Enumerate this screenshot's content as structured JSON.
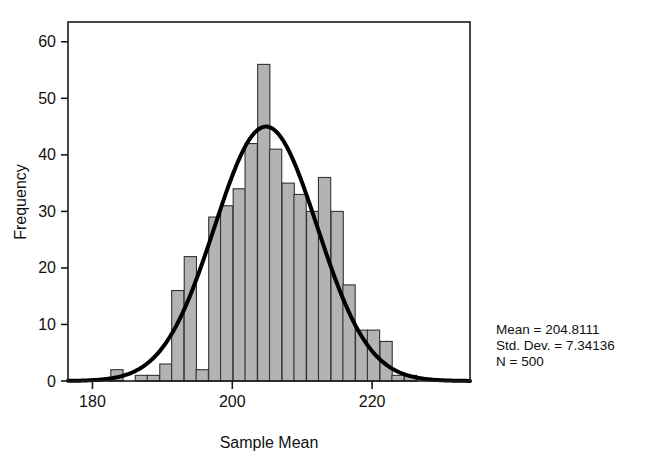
{
  "chart_data": {
    "type": "bar",
    "title": "",
    "subtitle": "",
    "xlabel": "Sample Mean",
    "ylabel": "Frequency",
    "xlim": [
      176.5,
      234.0
    ],
    "ylim": [
      0,
      63.5
    ],
    "xticks": [
      180,
      200,
      220
    ],
    "yticks": [
      0,
      10,
      20,
      30,
      40,
      50,
      60
    ],
    "grid": false,
    "legend": null,
    "bin_width": 1.75,
    "categories": [
      183.5,
      185.2,
      187.0,
      188.7,
      190.5,
      192.2,
      194.0,
      195.7,
      197.5,
      199.2,
      201.0,
      202.7,
      204.5,
      206.2,
      208.0,
      209.7,
      211.5,
      213.2,
      215.0,
      216.7,
      218.5,
      220.2,
      222.0,
      223.7,
      225.5,
      227.2
    ],
    "values": [
      2,
      0,
      1,
      1,
      3,
      16,
      22,
      2,
      29,
      31,
      34,
      42,
      56,
      41,
      35,
      33,
      30,
      36,
      30,
      17,
      9,
      9,
      7,
      1,
      1,
      0
    ],
    "overlay_curve": {
      "name": "Normal",
      "mean": 204.8111,
      "std_dev": 7.34136,
      "n": 500,
      "peak_value": 45,
      "color": "#000000",
      "line_width": 4
    },
    "bar_fill_color": "#b3b3b3",
    "bar_edge_color": "#333333",
    "axis_color": "#1a1a1a",
    "background_color": "#ffffff"
  },
  "axes": {
    "y_axis": {
      "title": "Frequency",
      "ticks": [
        "0",
        "10",
        "20",
        "30",
        "40",
        "50",
        "60"
      ]
    },
    "x_axis": {
      "title": "Sample Mean",
      "ticks": [
        "180",
        "200",
        "220"
      ]
    }
  },
  "stats_box": {
    "mean_label": "Mean = 204.8111",
    "std_dev_label": "Std. Dev. = 7.34136",
    "n_label": "N = 500"
  }
}
